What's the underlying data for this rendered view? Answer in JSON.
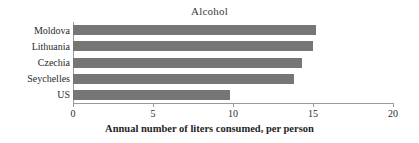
{
  "chart_data": {
    "type": "bar",
    "orientation": "horizontal",
    "title": "Alcohol",
    "xlabel": "Annual number of liters consumed, per person",
    "ylabel": "",
    "categories": [
      "Moldova",
      "Lithuania",
      "Czechia",
      "Seychelles",
      "US"
    ],
    "values": [
      15.2,
      15.0,
      14.3,
      13.8,
      9.8
    ],
    "xlim": [
      0,
      20
    ],
    "xticks": [
      0,
      5,
      10,
      15,
      20
    ],
    "xtick_labels": [
      "0",
      "5",
      "10",
      "15",
      "20"
    ],
    "grid": false,
    "legend": false,
    "legend_position": "none",
    "bar_color": "#767676",
    "axis_color": "#9a9a9a",
    "background_color": "#ffffff"
  }
}
